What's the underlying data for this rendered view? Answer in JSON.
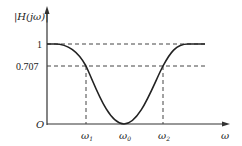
{
  "diagram": {
    "type": "band-stop filter magnitude response",
    "y_axis_label": "|H(jω)|",
    "x_axis_label": "ω",
    "origin_label": "O",
    "y_ticks": [
      {
        "label": "1",
        "value": 1
      },
      {
        "label": "0.707",
        "value": 0.707
      }
    ],
    "x_ticks": [
      {
        "label": "ω",
        "sub": "1"
      },
      {
        "label": "ω",
        "sub": "0"
      },
      {
        "label": "ω",
        "sub": "2"
      }
    ],
    "colors": {
      "curve": "#222222",
      "axis": "#333333",
      "dashed": "#444444"
    }
  }
}
